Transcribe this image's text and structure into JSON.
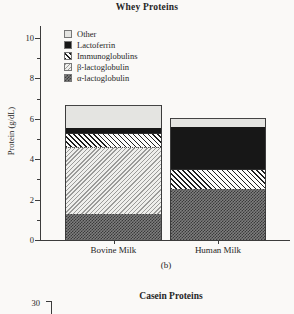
{
  "figure": {
    "subfigure_caption": "(b)",
    "background": "#faf9f7",
    "ink_color": "#262626"
  },
  "chart_data": {
    "type": "bar",
    "stacked": true,
    "title": "Whey Proteins",
    "xlabel": "",
    "ylabel": "Protein (g/dL)",
    "categories": [
      "Bovine Milk",
      "Human Milk"
    ],
    "ylim": [
      0,
      10
    ],
    "yticks": [
      0,
      2,
      4,
      6,
      8,
      10
    ],
    "minor_yticks": [
      1,
      3,
      5,
      7,
      9
    ],
    "grid": false,
    "legend_position": "upper-left-inside",
    "series": [
      {
        "name": "α-lactoglobulin",
        "values": [
          1.3,
          2.5
        ],
        "pattern": "checker"
      },
      {
        "name": "β-lactoglobulin",
        "values": [
          3.3,
          0
        ],
        "pattern": "hatch-fwd"
      },
      {
        "name": "Immunoglobulins",
        "values": [
          0.7,
          1.0
        ],
        "pattern": "hatch-back"
      },
      {
        "name": "Lactoferrin",
        "values": [
          0.25,
          2.1
        ],
        "pattern": "solid-black"
      },
      {
        "name": "Other",
        "values": [
          1.15,
          0.45
        ],
        "pattern": "solid-light"
      }
    ],
    "totals": [
      6.7,
      6.05
    ],
    "segment_colors": {
      "other": "#e4e4e1",
      "lactoferrin": "#171717",
      "alpha_lactoglobulin_avg": "#5a5a5a"
    }
  },
  "legend": {
    "items": [
      {
        "label": "Other",
        "pattern": "solid-light"
      },
      {
        "label": "Lactoferrin",
        "pattern": "solid-black"
      },
      {
        "label": "Immunoglobulins",
        "pattern": "hatch-back"
      },
      {
        "label": "β-lactoglobulin",
        "pattern": "hatch-fwd"
      },
      {
        "label": "α-lactoglobulin",
        "pattern": "checker"
      }
    ]
  },
  "next_chart": {
    "title": "Casein Proteins",
    "visible_tick_label": "30"
  }
}
